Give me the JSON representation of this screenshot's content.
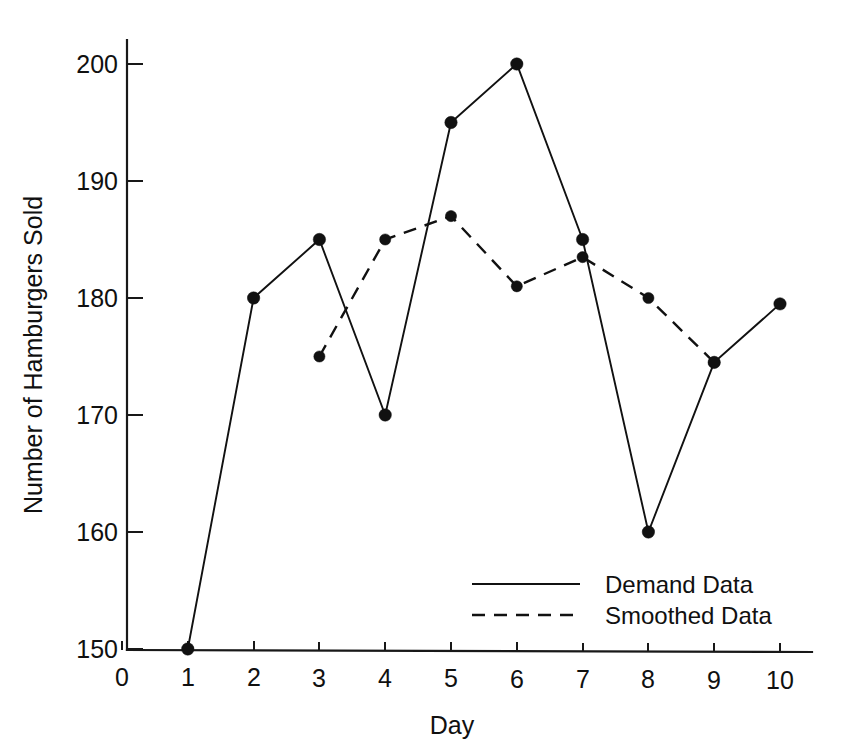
{
  "chart_data": {
    "type": "line",
    "title": "",
    "xlabel": "Day",
    "ylabel": "Number of Hamburgers Sold",
    "x": [
      1,
      2,
      3,
      4,
      5,
      6,
      7,
      8,
      9,
      10
    ],
    "xlim": [
      0,
      10.5
    ],
    "ylim": [
      150,
      202
    ],
    "xticks": [
      0,
      1,
      2,
      3,
      4,
      5,
      6,
      7,
      8,
      9,
      10
    ],
    "xticklabels": [
      "0",
      "1",
      "2",
      "3",
      "4",
      "5",
      "6",
      "7",
      "8",
      "9",
      "10"
    ],
    "yticks": [
      150,
      160,
      170,
      180,
      190,
      200
    ],
    "yticklabels": [
      "150",
      "160",
      "170",
      "180",
      "190",
      "200"
    ],
    "grid": false,
    "legend_position": "center-right-lower",
    "series": [
      {
        "name": "Demand Data",
        "style": "solid",
        "marker": "filled-circle",
        "color": "#111111",
        "x": [
          1,
          2,
          3,
          4,
          5,
          6,
          7,
          8,
          9,
          10
        ],
        "values": [
          150,
          180,
          185,
          170,
          195,
          200,
          185,
          160,
          174.5,
          179.5
        ]
      },
      {
        "name": "Smoothed Data",
        "style": "dashed",
        "marker": "filled-circle",
        "color": "#111111",
        "x": [
          3,
          4,
          5,
          6,
          7,
          8,
          9
        ],
        "values": [
          175,
          185,
          187,
          181,
          183.5,
          180,
          174.5
        ]
      }
    ]
  },
  "axes": {
    "y_title": "Number of Hamburgers Sold",
    "x_title": "Day",
    "y_tick_labels": [
      "200",
      "190",
      "180",
      "170",
      "160",
      "150"
    ],
    "x_tick_labels": [
      "0",
      "1",
      "2",
      "3",
      "4",
      "5",
      "6",
      "7",
      "8",
      "9",
      "10"
    ]
  },
  "legend": {
    "entries": [
      {
        "label": "Demand Data",
        "style": "solid"
      },
      {
        "label": "Smoothed Data",
        "style": "dashed"
      }
    ]
  }
}
